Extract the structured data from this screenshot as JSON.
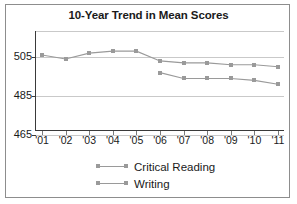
{
  "chart_data": {
    "type": "line",
    "title": "10-Year Trend in Mean Scores",
    "xlabel": "",
    "ylabel": "",
    "categories": [
      "'01",
      "'02",
      "'03",
      "'04",
      "'05",
      "'06",
      "'07",
      "'08",
      "'09",
      "'10",
      "'11"
    ],
    "yticks": [
      465,
      485,
      505
    ],
    "ylim": [
      465,
      515
    ],
    "grid": true,
    "legend_position": "bottom",
    "series": [
      {
        "name": "Critical Reading",
        "color": "#9a9a9a",
        "values": [
          506,
          504,
          507,
          508,
          508,
          503,
          502,
          502,
          501,
          501,
          500
        ]
      },
      {
        "name": "Writing",
        "color": "#9a9a9a",
        "values": [
          null,
          null,
          null,
          null,
          null,
          497,
          494,
          494,
          494,
          493,
          491
        ]
      }
    ]
  },
  "legend": {
    "items": [
      {
        "label": "Critical Reading"
      },
      {
        "label": "Writing"
      }
    ]
  }
}
